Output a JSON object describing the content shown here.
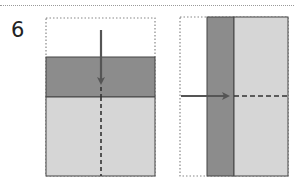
{
  "step": {
    "number": "6"
  },
  "colors": {
    "dark_band": "#8c8c8c",
    "light_area": "#d6d6d6",
    "outline": "#444444",
    "dotted_outline": "#888888",
    "arrow": "#555555",
    "fold_line": "#333333"
  },
  "figures": [
    {
      "id": "left",
      "description": "Vertical fold: top edge folded down to meet the middle; downward arrow with dashed vertical fold line",
      "arrow_direction": "down"
    },
    {
      "id": "right",
      "description": "Horizontal fold: left edge folded right; rightward arrow with dashed horizontal fold line",
      "arrow_direction": "right"
    }
  ]
}
